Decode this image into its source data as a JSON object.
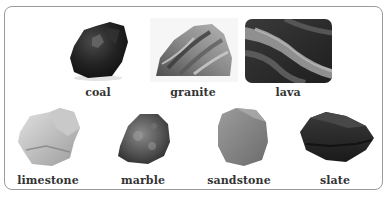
{
  "colors": {
    "border": "#9a9a9a",
    "label_text": "#333333",
    "background": "#ffffff"
  },
  "rocks": [
    {
      "name": "coal",
      "row": 1
    },
    {
      "name": "granite",
      "row": 1
    },
    {
      "name": "lava",
      "row": 1
    },
    {
      "name": "limestone",
      "row": 2
    },
    {
      "name": "marble",
      "row": 2
    },
    {
      "name": "sandstone",
      "row": 2
    },
    {
      "name": "slate",
      "row": 2
    }
  ]
}
